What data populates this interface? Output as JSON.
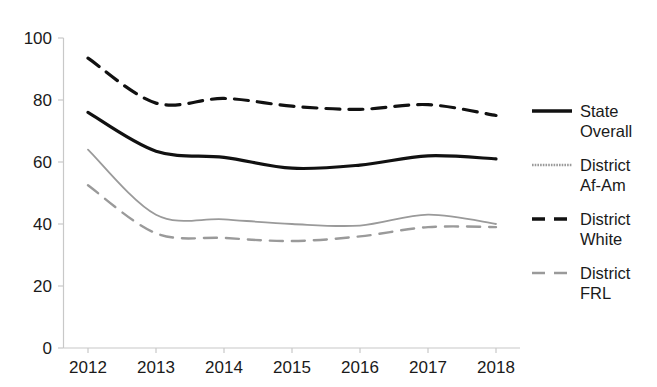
{
  "chart_data": {
    "type": "line",
    "title": "",
    "subtitle": "",
    "xlabel": "",
    "ylabel": "",
    "categories": [
      "2012",
      "2013",
      "2014",
      "2015",
      "2016",
      "2017",
      "2018"
    ],
    "x": [
      2012,
      2013,
      2014,
      2015,
      2016,
      2017,
      2018
    ],
    "xlim": [
      2012,
      2018
    ],
    "ylim": [
      0,
      100
    ],
    "y_ticks": [
      0,
      20,
      40,
      60,
      80,
      100
    ],
    "x_ticks": [
      "2012",
      "2013",
      "2014",
      "2015",
      "2016",
      "2017",
      "2018"
    ],
    "grid": false,
    "legend_position": "right",
    "series": [
      {
        "name": "State Overall",
        "legend_label_line1": "State",
        "legend_label_line2": "Overall",
        "values": [
          76,
          63.5,
          61.5,
          58,
          59,
          62,
          61
        ],
        "color": "#111111",
        "style": "solid",
        "width": 3.2
      },
      {
        "name": "District Af-Am",
        "legend_label_line1": "District",
        "legend_label_line2": "Af-Am",
        "values": [
          64,
          43,
          41.5,
          40,
          39.5,
          43,
          40
        ],
        "color": "#9a9a9a",
        "style": "solid",
        "width": 1.8
      },
      {
        "name": "District White",
        "legend_label_line1": "District",
        "legend_label_line2": "White",
        "values": [
          93.5,
          79,
          80.5,
          78,
          77,
          78.5,
          75
        ],
        "color": "#111111",
        "style": "dashed",
        "width": 3.2
      },
      {
        "name": "District FRL",
        "legend_label_line1": "District",
        "legend_label_line2": "FRL",
        "values": [
          52.5,
          37,
          35.5,
          34.5,
          36,
          39,
          39
        ],
        "color": "#9a9a9a",
        "style": "dashed",
        "width": 2.4
      }
    ]
  },
  "axes": {
    "y_tick_labels": [
      "100",
      "80",
      "60",
      "40",
      "20",
      "0"
    ],
    "x_tick_labels": [
      "2012",
      "2013",
      "2014",
      "2015",
      "2016",
      "2017",
      "2018"
    ],
    "axis_color": "#c8c8c8"
  },
  "legend": {
    "items": [
      {
        "label_line1": "State",
        "label_line2": "Overall",
        "swatch": "solid-black-line"
      },
      {
        "label_line1": "District",
        "label_line2": "Af-Am",
        "swatch": "dotted-gray-line"
      },
      {
        "label_line1": "District",
        "label_line2": "White",
        "swatch": "dashed-black-line"
      },
      {
        "label_line1": "District",
        "label_line2": "FRL",
        "swatch": "dashed-gray-line"
      }
    ]
  }
}
